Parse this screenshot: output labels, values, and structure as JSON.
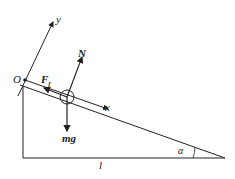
{
  "diagram": {
    "labels": {
      "origin": "O",
      "y_axis": "y",
      "x_axis": "x",
      "normal": "N",
      "friction": "F",
      "friction_sub": "f",
      "weight": "mg",
      "length": "l",
      "angle": "α"
    },
    "colors": {
      "stroke": "#222222",
      "background": "#ffffff"
    }
  }
}
